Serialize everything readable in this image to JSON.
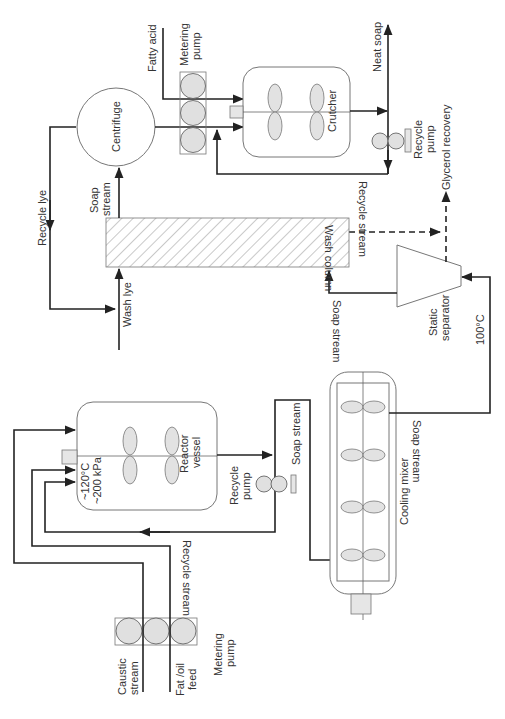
{
  "diagram": {
    "orientation": "rotated 90° (read with page turned)",
    "equipment": {
      "metering_pump_feed": "Metering pump",
      "metering_pump_fatty": "Metering pump",
      "reactor_vessel": "Reactor vessel",
      "reactor_conditions": [
        "~120°C",
        "~200 kPa"
      ],
      "recycle_pump_reactor": "Recycle pump",
      "cooling_mixer": "Cooling mixer",
      "static_separator": "Static separator",
      "wash_column": "Wash column",
      "centrifuge": "Centrifuge",
      "crutcher": "Crutcher",
      "recycle_pump_crutcher": "Recycle pump"
    },
    "streams": {
      "caustic": "Caustic stream",
      "fat_oil": "Fat /oil feed",
      "recycle_reactor": "Recycle stream",
      "soap_to_mixer": "Soap stream",
      "soap_to_separator": "Soap stream",
      "separator_temp": "100°C",
      "soap_to_column": "Soap stream",
      "wash_lye": "Wash lye",
      "soap_to_centrifuge": "Soap stream",
      "recycle_lye": "Recycle lye",
      "fatty_acid": "Fatty acid",
      "recycle_crutcher": "Recycle stream",
      "neat_soap": "Neat soap",
      "glycerol": "Glycerol recovery"
    }
  }
}
